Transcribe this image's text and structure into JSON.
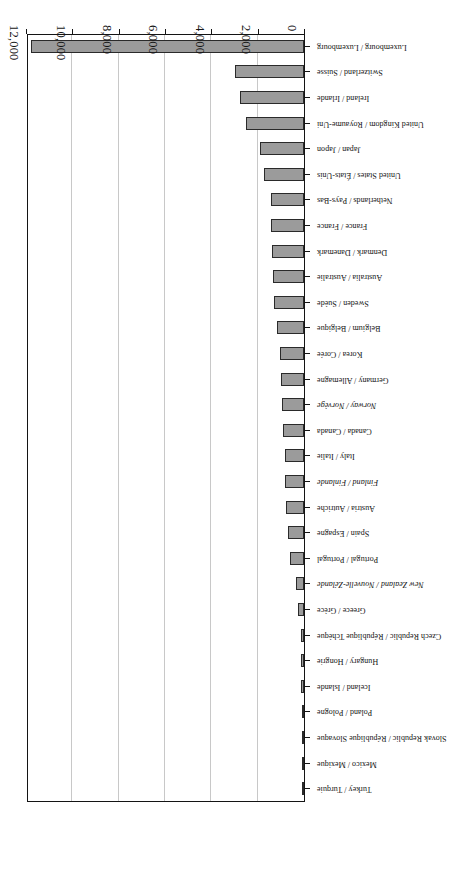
{
  "chart_data": {
    "type": "bar",
    "orientation": "horizontal",
    "title": "",
    "subtitle": "",
    "xlabel": "",
    "ylabel": "",
    "xlim": [
      0,
      12000
    ],
    "xticks": [
      0,
      2000,
      4000,
      6000,
      8000,
      10000,
      12000
    ],
    "xtick_labels": [
      "0",
      "2,000",
      "4,000",
      "6,000",
      "8,000",
      "10,000",
      "12,000"
    ],
    "grid": "vertical",
    "legend": "none",
    "bar_color": "#9b9b9b",
    "bar_edge_color": "#2a2a2a",
    "axis_color": "#141414",
    "gridline_color": "#c8c8c8",
    "rotation": "180deg",
    "categories": [
      "Luxembourg / Luxembourg",
      "Switzerland / Suisse",
      "Ireland / Irlande",
      "United Kingdom / Royaume-Uni",
      "Japan / Japon",
      "United States / États-Unis",
      "Netherlands / Pays-Bas",
      "France / France",
      "Denmark / Danemark",
      "Australia / Australie",
      "Sweden / Suède",
      "Belgium / Belgique",
      "Korea / Corée",
      "Germany / Allemagne",
      "Norway / Norvège",
      "Canada / Canada",
      "Italy / Italie",
      "Finland / Finlande",
      "Austria / Autriche",
      "Spain / Espagne",
      "Portugal / Portugal",
      "New Zealand / Nouvelle-Zélande",
      "Greece / Grèce",
      "Czech Republic / République Tchèque",
      "Hungary / Hongrie",
      "Iceland / Islande",
      "Poland / Pologne",
      "Slovak Republic / République Slovaque",
      "Mexico / Mexique",
      "Turkey / Turquie"
    ],
    "italic_categories": [
      "New Zealand / Nouvelle-Zélande",
      "Norway / Norvège",
      "Finland / Finlande"
    ],
    "values": [
      11800,
      2960,
      2760,
      2520,
      1920,
      1720,
      1440,
      1410,
      1380,
      1350,
      1310,
      1160,
      1050,
      1010,
      940,
      920,
      830,
      800,
      760,
      700,
      600,
      330,
      260,
      140,
      120,
      110,
      100,
      90,
      85,
      20
    ]
  }
}
